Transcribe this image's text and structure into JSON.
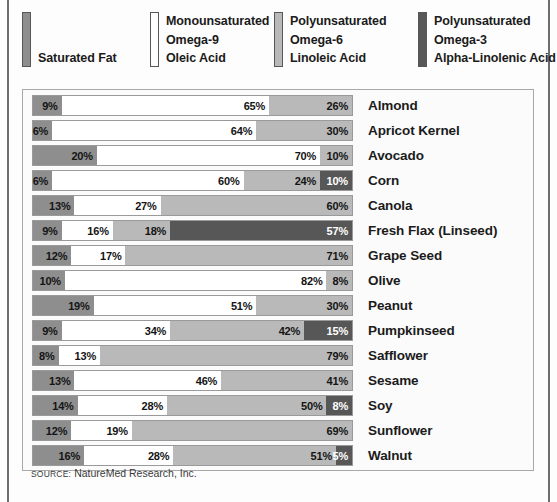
{
  "legend": {
    "items": [
      {
        "id": "saturated",
        "swatch_color": "#8e8e8e",
        "line1": "",
        "line2": "",
        "line3": "Saturated Fat"
      },
      {
        "id": "omega9",
        "swatch_color": "#ffffff",
        "line1": "Monounsaturated",
        "line2": "Omega-9",
        "line3": "Oleic Acid"
      },
      {
        "id": "omega6",
        "swatch_color": "#b9b9b9",
        "line1": "Polyunsaturated",
        "line2": "Omega-6",
        "line3": "Linoleic Acid"
      },
      {
        "id": "omega3",
        "swatch_color": "#575757",
        "line1": "Polyunsaturated",
        "line2": "Omega-3",
        "line3": "Alpha-Linolenic Acid"
      }
    ]
  },
  "source": {
    "label": "Source:",
    "text": "NatureMed Research, Inc."
  },
  "chart_data": {
    "type": "bar",
    "orientation": "horizontal",
    "stacked": true,
    "title": "",
    "xlabel": "",
    "ylabel": "",
    "xlim": [
      0,
      100
    ],
    "grid": false,
    "legend_position": "top",
    "value_suffix": "%",
    "series": [
      {
        "name": "Saturated Fat",
        "color": "#8e8e8e",
        "values": [
          9,
          6,
          20,
          6,
          13,
          9,
          12,
          10,
          19,
          9,
          8,
          13,
          14,
          12,
          16
        ]
      },
      {
        "name": "Monounsaturated Omega-9 Oleic Acid",
        "color": "#ffffff",
        "values": [
          65,
          64,
          70,
          60,
          27,
          16,
          17,
          82,
          51,
          34,
          13,
          46,
          28,
          19,
          28
        ]
      },
      {
        "name": "Polyunsaturated Omega-6 Linoleic Acid",
        "color": "#b9b9b9",
        "values": [
          26,
          30,
          10,
          24,
          60,
          18,
          71,
          8,
          30,
          42,
          79,
          41,
          50,
          69,
          51
        ]
      },
      {
        "name": "Polyunsaturated Omega-3 Alpha-Linolenic Acid",
        "color": "#575757",
        "values": [
          0,
          0,
          0,
          10,
          0,
          57,
          0,
          0,
          0,
          15,
          0,
          0,
          8,
          0,
          5
        ]
      }
    ],
    "categories": [
      "Almond",
      "Apricot Kernel",
      "Avocado",
      "Corn",
      "Canola",
      "Fresh Flax (Linseed)",
      "Grape Seed",
      "Olive",
      "Peanut",
      "Pumpkinseed",
      "Safflower",
      "Sesame",
      "Soy",
      "Sunflower",
      "Walnut"
    ]
  }
}
